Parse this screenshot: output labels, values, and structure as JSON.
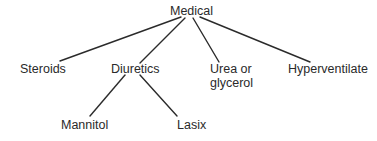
{
  "diagram": {
    "type": "tree",
    "root": {
      "id": "medical",
      "label": "Medical",
      "children": [
        {
          "id": "steroids",
          "label": "Steroids"
        },
        {
          "id": "diuretics",
          "label": "Diuretics",
          "children": [
            {
              "id": "mannitol",
              "label": "Mannitol"
            },
            {
              "id": "lasix",
              "label": "Lasix"
            }
          ]
        },
        {
          "id": "urea",
          "label_line1": "Urea or",
          "label_line2": "glycerol"
        },
        {
          "id": "hyperventilate",
          "label": "Hyperventilate"
        }
      ]
    },
    "edges": [
      {
        "from": "Medical",
        "to": "Steroids"
      },
      {
        "from": "Medical",
        "to": "Diuretics"
      },
      {
        "from": "Medical",
        "to": "Urea or glycerol"
      },
      {
        "from": "Medical",
        "to": "Hyperventilate"
      },
      {
        "from": "Diuretics",
        "to": "Mannitol"
      },
      {
        "from": "Diuretics",
        "to": "Lasix"
      }
    ],
    "colors": {
      "text": "#2a2a2a",
      "line": "#2b2b2b",
      "background": "#ffffff"
    }
  },
  "labels": {
    "medical": "Medical",
    "steroids": "Steroids",
    "diuretics": "Diuretics",
    "urea_line1": "Urea or",
    "urea_line2": "glycerol",
    "hyperventilate": "Hyperventilate",
    "mannitol": "Mannitol",
    "lasix": "Lasix"
  }
}
